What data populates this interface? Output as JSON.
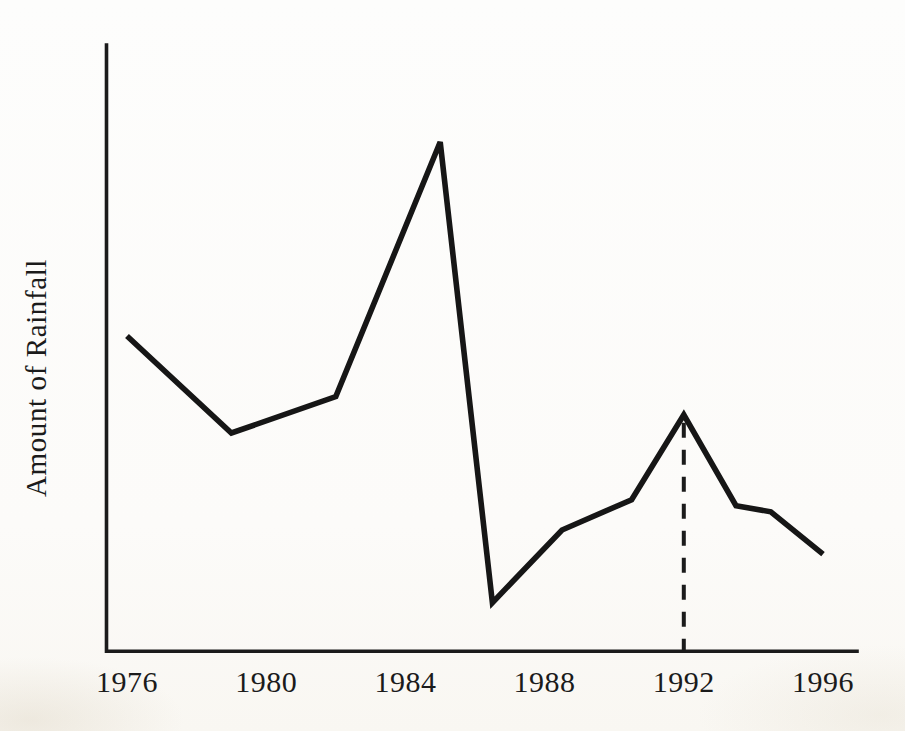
{
  "page": {
    "paper_color": "#fcfbf9",
    "ink_color": "#1b1b1b"
  },
  "chart_data": {
    "type": "line",
    "title": "",
    "xlabel": "",
    "ylabel": "Amount of Rainfall",
    "x_tick_labels": [
      "1976",
      "1980",
      "1984",
      "1988",
      "1992",
      "1996"
    ],
    "x_tick_years": [
      1976,
      1980,
      1984,
      1988,
      1992,
      1996
    ],
    "x_range": [
      1975.5,
      1997
    ],
    "ylim": [
      0,
      100
    ],
    "y_axis_numeric_scale_shown": false,
    "grid": false,
    "legend": "none",
    "series": [
      {
        "name": "Amount of Rainfall",
        "points": [
          {
            "year": 1976,
            "value": 52
          },
          {
            "year": 1979,
            "value": 36
          },
          {
            "year": 1982,
            "value": 42
          },
          {
            "year": 1985,
            "value": 84
          },
          {
            "year": 1986.5,
            "value": 8
          },
          {
            "year": 1988.5,
            "value": 20
          },
          {
            "year": 1990.5,
            "value": 25
          },
          {
            "year": 1992,
            "value": 39
          },
          {
            "year": 1993.5,
            "value": 24
          },
          {
            "year": 1994.5,
            "value": 23
          },
          {
            "year": 1996,
            "value": 16
          }
        ]
      }
    ],
    "annotations": {
      "dashed_vertical_line_year": 1992,
      "dashed_vertical_line_from_value": 39,
      "dashed_vertical_line_to_value": 0
    }
  }
}
